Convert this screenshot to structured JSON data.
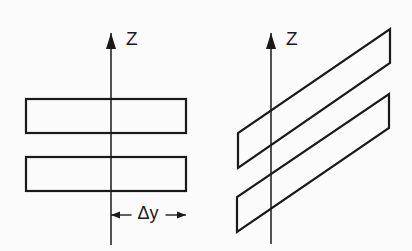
{
  "figure": {
    "background_color": "#fbfbfb",
    "ink_color": "#1a1a1a",
    "width": 412,
    "height": 251,
    "caption": ""
  },
  "left_view": {
    "name": "front-view",
    "axis": {
      "label": "Z",
      "label_x": 126,
      "label_y": 40,
      "x": 111,
      "y_top": 33,
      "y_bottom": 245,
      "arrow_half_width": 5,
      "arrow_length": 16
    },
    "plates": [
      {
        "label": "upper-plate",
        "x": 26,
        "y": 99,
        "width": 160,
        "height": 34
      },
      {
        "label": "lower-plate",
        "x": 26,
        "y": 157,
        "width": 160,
        "height": 34
      }
    ],
    "dimension": {
      "label": "Δy",
      "x_start": 111,
      "x_end": 186,
      "y": 215,
      "label_x": 148,
      "label_y": 214,
      "arrow_half_width": 3.5,
      "arrow_length": 9,
      "gap_half_width": 17
    }
  },
  "right_view": {
    "name": "perspective-view",
    "axis": {
      "label": "Z",
      "label_x": 286,
      "label_y": 40,
      "x": 271,
      "y_top": 33,
      "y_bottom": 244,
      "arrow_half_width": 5,
      "arrow_length": 16
    },
    "plates": [
      {
        "label": "upper-plate",
        "points": "390,29 390,63 238,168 238,133"
      },
      {
        "label": "lower-plate",
        "points": "389,94 389,128 237,232 237,197"
      }
    ]
  }
}
